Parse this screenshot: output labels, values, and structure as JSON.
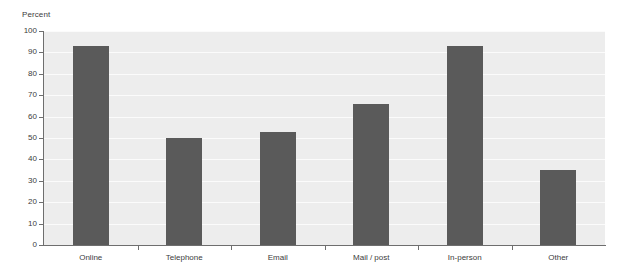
{
  "chart_data": {
    "type": "bar",
    "title": "",
    "subtitle": "",
    "xlabel": "",
    "ylabel": "Percent",
    "ylim": [
      0,
      100
    ],
    "ytick_step": 10,
    "yticks": [
      100,
      90,
      80,
      70,
      60,
      50,
      40,
      30,
      20,
      10,
      0
    ],
    "categories": [
      "Online",
      "Telephone",
      "Email",
      "Mail / post",
      "In-person",
      "Other"
    ],
    "values": [
      93,
      50,
      53,
      66,
      93,
      35
    ],
    "grid": true,
    "grid_orientation": "horizontal",
    "legend": false,
    "legend_position": "none",
    "colors": {
      "bar": "#5a5a5a",
      "plot_background": "#ededed",
      "gridline": "#fbfbfb",
      "axis": "#6e6e6e",
      "text": "#3c3c3c",
      "page_background": "#ffffff"
    }
  }
}
